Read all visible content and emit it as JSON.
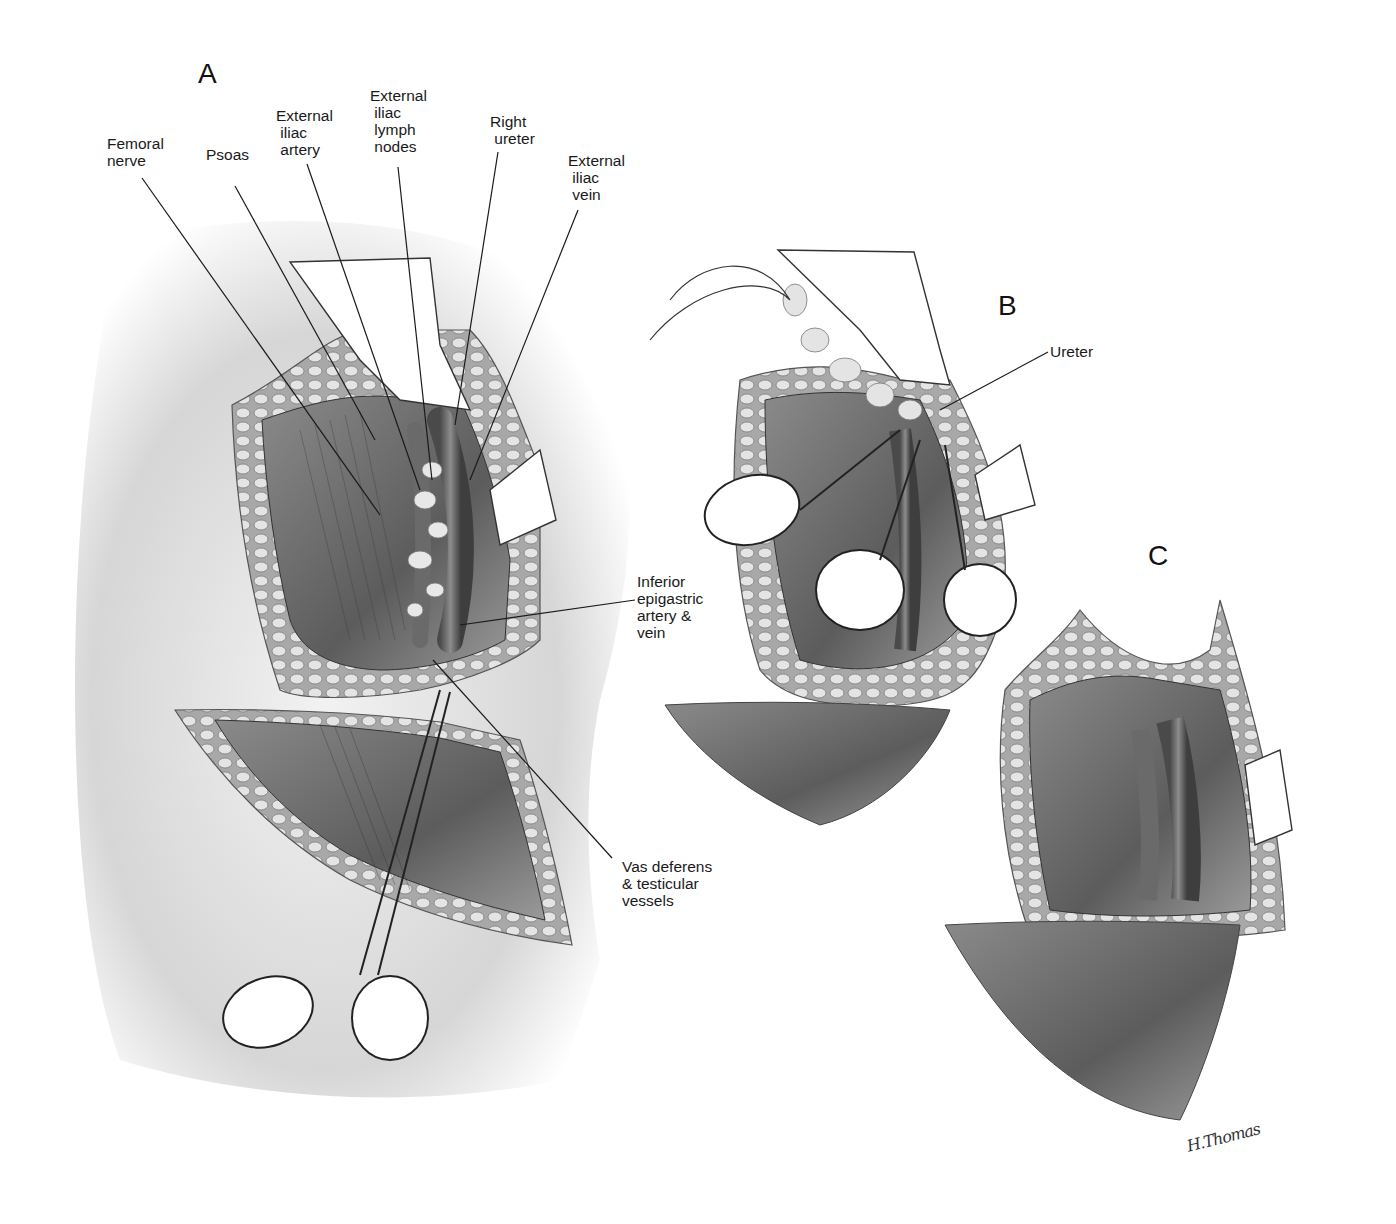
{
  "figure": {
    "panels": [
      {
        "id": "A",
        "letter": "A"
      },
      {
        "id": "B",
        "letter": "B"
      },
      {
        "id": "C",
        "letter": "C"
      }
    ],
    "panel_a_labels": {
      "femoral_nerve": "Femoral\nnerve",
      "psoas": "Psoas",
      "external_iliac_artery": "External\n iliac\n artery",
      "external_iliac_lymph_nodes": "External\n iliac\n lymph\n nodes",
      "right_ureter": "Right\n ureter",
      "external_iliac_vein": "External\n iliac\n vein",
      "inferior_epigastric": "Inferior\nepigastric\nartery &\nvein",
      "vas_deferens": "Vas deferens\n& testicular\nvessels"
    },
    "panel_b_labels": {
      "ureter": "Ureter"
    },
    "signature": "H.Thomas",
    "colors": {
      "ink": "#1a1a1a",
      "skin": "#dcdcdc",
      "tissue_dark": "#6e6e6e",
      "fat": "#bdbdbd",
      "retractor": "#ffffff"
    }
  }
}
